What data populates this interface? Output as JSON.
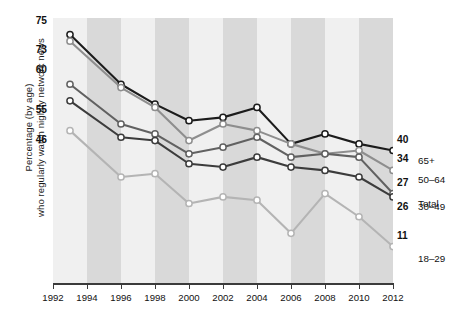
{
  "chart_data": {
    "type": "line",
    "title": "",
    "xlabel": "",
    "ylabel": "Percentage (by age) who regularly watch nightly network news",
    "ylabel_line1": "Percentage (by age)",
    "ylabel_line2": "who regularly watch nightly network news",
    "x": [
      1993,
      1996,
      1998,
      2000,
      2002,
      2004,
      2006,
      2008,
      2010,
      2012
    ],
    "xtick_labels": [
      "1992",
      "1994",
      "1996",
      "1998",
      "2000",
      "2002",
      "2004",
      "2006",
      "2008",
      "2010",
      "2012"
    ],
    "xtick_values": [
      1992,
      1994,
      1996,
      1998,
      2000,
      2002,
      2004,
      2006,
      2008,
      2010,
      2012
    ],
    "xlim": [
      1992,
      2012
    ],
    "ylim": [
      0,
      80
    ],
    "grid": false,
    "legend_position": "right-inline",
    "series": [
      {
        "name": "65+",
        "color": "#1c1c1c",
        "start_label": "75",
        "end_label": "40",
        "values": [
          75,
          60,
          54,
          49,
          50,
          53,
          42,
          45,
          42,
          40
        ]
      },
      {
        "name": "50-64",
        "color": "#8e8e8e",
        "start_label": "73",
        "end_label": "34",
        "values": [
          73,
          59,
          53,
          43,
          48,
          46,
          42,
          39,
          40,
          34
        ]
      },
      {
        "name": "Total",
        "color": "#616161",
        "start_label": "60",
        "end_label": "27",
        "values": [
          60,
          48,
          45,
          39,
          41,
          44,
          38,
          39,
          38,
          27
        ]
      },
      {
        "name": "30-49",
        "color": "#3c3c3c",
        "start_label": "55",
        "end_label": "26",
        "values": [
          55,
          44,
          43,
          36,
          35,
          38,
          35,
          34,
          32,
          26
        ]
      },
      {
        "name": "18-29",
        "color": "#b4b4b4",
        "start_label": "46",
        "end_label": "11",
        "values": [
          46,
          32,
          33,
          24,
          26,
          25,
          15,
          27,
          20,
          11
        ]
      }
    ],
    "left_value_labels": [
      "75",
      "73",
      "60",
      "55",
      "46"
    ],
    "right_value_labels": [
      "40",
      "34",
      "27",
      "26",
      "11"
    ],
    "right_series_labels": [
      "65+",
      "50–64",
      "Total",
      "30–49",
      "18–29"
    ],
    "band_colors": {
      "light": "#f0f0f0",
      "dark": "#d9d9d9"
    },
    "marker": {
      "shape": "circle",
      "fill": "#ffffff",
      "edge": "series-color"
    }
  }
}
